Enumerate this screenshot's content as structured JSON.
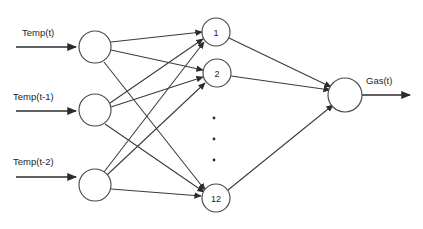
{
  "diagram": {
    "type": "neural-network-architecture",
    "title": "",
    "background_color": "#ffffff",
    "edge_color": "#3a3a3a",
    "node_stroke_color": "#4a4a4a",
    "node_fill_color": "#ffffff",
    "text_color": "#1d1d1d",
    "canvas": {
      "width": 423,
      "height": 229
    }
  },
  "input_layer": {
    "name": "input-layer",
    "node_radius": 16,
    "nodes": [
      {
        "id": "in-1",
        "label": "",
        "cx": 95,
        "cy": 47
      },
      {
        "id": "in-2",
        "label": "",
        "cx": 95,
        "cy": 110
      },
      {
        "id": "in-3",
        "label": "",
        "cx": 95,
        "cy": 185
      }
    ],
    "inputs": [
      {
        "id": "input-arrow-1",
        "label": "Temp(t)",
        "label_x": 22,
        "label_y": 36,
        "x1": 16,
        "y1": 47,
        "x2": 76,
        "y2": 47
      },
      {
        "id": "input-arrow-2",
        "label": "Temp(t-1)",
        "label_x": 13,
        "label_y": 100,
        "x1": 16,
        "y1": 111,
        "x2": 76,
        "y2": 111
      },
      {
        "id": "input-arrow-3",
        "label": "Temp(t-2)",
        "label_x": 13,
        "label_y": 165,
        "x1": 16,
        "y1": 177,
        "x2": 76,
        "y2": 177
      }
    ]
  },
  "hidden_layer": {
    "name": "hidden-layer",
    "node_radius": 14,
    "node_count_implied": 12,
    "nodes": [
      {
        "id": "hid-1",
        "label": "1",
        "cx": 216,
        "cy": 32
      },
      {
        "id": "hid-2",
        "label": "2",
        "cx": 217,
        "cy": 73
      },
      {
        "id": "hid-12",
        "label": "12",
        "cx": 216,
        "cy": 198
      }
    ],
    "ellipsis": {
      "name": "vertical-ellipsis",
      "dots": [
        {
          "cx": 214,
          "cy": 118
        },
        {
          "cx": 214,
          "cy": 139
        },
        {
          "cx": 214,
          "cy": 160
        }
      ],
      "radius": 1.4
    }
  },
  "output_layer": {
    "name": "output-layer",
    "node_radius": 17,
    "nodes": [
      {
        "id": "out-1",
        "label": "",
        "cx": 345,
        "cy": 95
      }
    ],
    "outputs": [
      {
        "id": "output-arrow-1",
        "label": "Gas(t)",
        "label_x": 366,
        "label_y": 84,
        "x1": 362,
        "y1": 95,
        "x2": 410,
        "y2": 95
      }
    ]
  },
  "edges": {
    "input_to_hidden": [
      {
        "from": "in-1",
        "to": "hid-1",
        "x1": 111,
        "y1": 42,
        "x2": 202,
        "y2": 32
      },
      {
        "from": "in-1",
        "to": "hid-2",
        "x1": 111,
        "y1": 50,
        "x2": 203,
        "y2": 70
      },
      {
        "from": "in-1",
        "to": "hid-12",
        "x1": 104,
        "y1": 62,
        "x2": 205,
        "y2": 190
      },
      {
        "from": "in-2",
        "to": "hid-1",
        "x1": 110,
        "y1": 103,
        "x2": 203,
        "y2": 39
      },
      {
        "from": "in-2",
        "to": "hid-2",
        "x1": 111,
        "y1": 107,
        "x2": 203,
        "y2": 77
      },
      {
        "from": "in-2",
        "to": "hid-12",
        "x1": 105,
        "y1": 124,
        "x2": 204,
        "y2": 192
      },
      {
        "from": "in-3",
        "to": "hid-1",
        "x1": 104,
        "y1": 172,
        "x2": 204,
        "y2": 42
      },
      {
        "from": "in-3",
        "to": "hid-2",
        "x1": 107,
        "y1": 175,
        "x2": 205,
        "y2": 83
      },
      {
        "from": "in-3",
        "to": "hid-12",
        "x1": 111,
        "y1": 189,
        "x2": 201,
        "y2": 196
      }
    ],
    "hidden_to_output": [
      {
        "from": "hid-1",
        "to": "out-1",
        "x1": 229,
        "y1": 38,
        "x2": 331,
        "y2": 87
      },
      {
        "from": "hid-2",
        "to": "out-1",
        "x1": 231,
        "y1": 76,
        "x2": 330,
        "y2": 90
      },
      {
        "from": "hid-12",
        "to": "out-1",
        "x1": 228,
        "y1": 190,
        "x2": 333,
        "y2": 105
      }
    ]
  }
}
